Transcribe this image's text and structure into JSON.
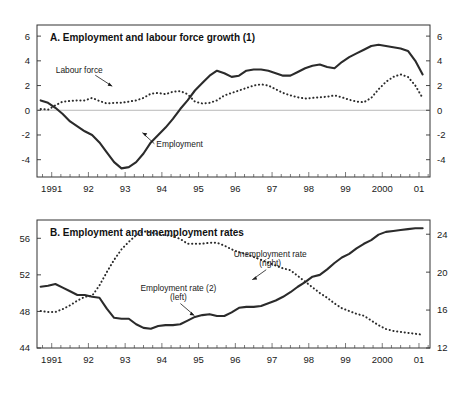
{
  "figure": {
    "background": "#ffffff",
    "series_color": "#2b2b2b",
    "frame_color": "#333333",
    "zeroline_color": "#b8b8b8"
  },
  "chart_data": [
    {
      "type": "line",
      "panel": "A",
      "title": "A. Employment and labour force growth (1)",
      "xlabel": "",
      "ylabel": "",
      "grid": false,
      "legend": "annotations",
      "x_ticklabels": [
        "1991",
        "92",
        "93",
        "94",
        "95",
        "96",
        "97",
        "98",
        "99",
        "2000",
        "01"
      ],
      "x_tickvalues": [
        1991,
        1992,
        1993,
        1994,
        1995,
        1996,
        1997,
        1998,
        1999,
        2000,
        2001
      ],
      "xlim": [
        1990.6,
        2001.3
      ],
      "ylim": [
        -5.4,
        6.9
      ],
      "y_left_ticks": [
        6,
        4,
        2,
        0,
        -2,
        -4
      ],
      "y_right_ticks": [
        6,
        4,
        2,
        0,
        -2,
        -4
      ],
      "zero_line": 0,
      "annotations": [
        {
          "text": "Labour force",
          "x": 1991.75,
          "y": 3.0
        },
        {
          "text": "Employment",
          "x": 1993.85,
          "y": -2.95
        }
      ],
      "series": [
        {
          "name": "Employment",
          "style": "solid",
          "x": [
            1990.7,
            1990.9,
            1991.1,
            1991.3,
            1991.5,
            1991.7,
            1991.9,
            1992.1,
            1992.3,
            1992.5,
            1992.7,
            1992.9,
            1993.1,
            1993.3,
            1993.5,
            1993.7,
            1993.9,
            1994.1,
            1994.3,
            1994.5,
            1994.7,
            1994.9,
            1995.1,
            1995.3,
            1995.5,
            1995.7,
            1995.9,
            1996.1,
            1996.3,
            1996.5,
            1996.7,
            1996.9,
            1997.1,
            1997.3,
            1997.5,
            1997.7,
            1997.9,
            1998.1,
            1998.3,
            1998.5,
            1998.7,
            1998.9,
            1999.1,
            1999.3,
            1999.5,
            1999.7,
            1999.9,
            2000.1,
            2000.3,
            2000.5,
            2000.7,
            2000.9,
            2001.1
          ],
          "values": [
            0.8,
            0.6,
            0.2,
            -0.3,
            -0.9,
            -1.3,
            -1.7,
            -2.0,
            -2.6,
            -3.4,
            -4.2,
            -4.7,
            -4.6,
            -4.2,
            -3.5,
            -2.6,
            -2.0,
            -1.4,
            -0.7,
            0.1,
            0.8,
            1.6,
            2.2,
            2.8,
            3.2,
            3.0,
            2.7,
            2.8,
            3.2,
            3.3,
            3.3,
            3.2,
            3.0,
            2.8,
            2.8,
            3.1,
            3.4,
            3.6,
            3.7,
            3.5,
            3.4,
            3.9,
            4.3,
            4.6,
            4.9,
            5.2,
            5.3,
            5.2,
            5.1,
            5.0,
            4.8,
            4.0,
            2.9
          ]
        },
        {
          "name": "Labour force",
          "style": "dotted",
          "x": [
            1990.7,
            1990.9,
            1991.1,
            1991.3,
            1991.5,
            1991.7,
            1991.9,
            1992.1,
            1992.3,
            1992.5,
            1992.7,
            1992.9,
            1993.1,
            1993.3,
            1993.5,
            1993.7,
            1993.9,
            1994.1,
            1994.3,
            1994.5,
            1994.7,
            1994.9,
            1995.1,
            1995.3,
            1995.5,
            1995.7,
            1995.9,
            1996.1,
            1996.3,
            1996.5,
            1996.7,
            1996.9,
            1997.1,
            1997.3,
            1997.5,
            1997.7,
            1997.9,
            1998.1,
            1998.3,
            1998.5,
            1998.7,
            1998.9,
            1999.1,
            1999.3,
            1999.5,
            1999.7,
            1999.9,
            2000.1,
            2000.3,
            2000.5,
            2000.7,
            2000.9,
            2001.1
          ],
          "values": [
            0.1,
            0.05,
            0.4,
            0.7,
            0.75,
            0.8,
            0.8,
            1.0,
            0.75,
            0.55,
            0.6,
            0.6,
            0.7,
            0.8,
            1.0,
            1.35,
            1.4,
            1.3,
            1.5,
            1.55,
            1.3,
            0.7,
            0.55,
            0.6,
            0.8,
            1.2,
            1.4,
            1.6,
            1.8,
            2.0,
            2.1,
            2.0,
            1.7,
            1.4,
            1.2,
            1.05,
            0.95,
            1.0,
            1.05,
            1.1,
            1.2,
            1.05,
            0.85,
            0.7,
            0.65,
            1.0,
            1.7,
            2.3,
            2.7,
            2.9,
            2.7,
            2.0,
            1.0
          ]
        }
      ]
    },
    {
      "type": "line",
      "panel": "B",
      "title": "B. Employment and unemployment rates",
      "xlabel": "",
      "ylabel": "",
      "grid": false,
      "legend": "annotations",
      "x_ticklabels": [
        "1991",
        "92",
        "93",
        "94",
        "95",
        "96",
        "97",
        "98",
        "99",
        "2000",
        "01"
      ],
      "x_tickvalues": [
        1991,
        1992,
        1993,
        1994,
        1995,
        1996,
        1997,
        1998,
        1999,
        2000,
        2001
      ],
      "xlim": [
        1990.6,
        2001.3
      ],
      "ylim_left": [
        44,
        58
      ],
      "ylim_right": [
        12,
        25.5
      ],
      "y_left_ticks": [
        56,
        52,
        48,
        44
      ],
      "y_right_ticks": [
        24,
        20,
        16,
        12
      ],
      "annotations": [
        {
          "text": "Employment rate (2)",
          "x": 1994.45,
          "y_left": 50.2
        },
        {
          "text": "(left)",
          "x": 1994.45,
          "y_left": 49.3
        },
        {
          "text": "Unemployment rate",
          "x": 1996.95,
          "y_left": 53.9
        },
        {
          "text": "(right)",
          "x": 1996.95,
          "y_left": 53.0
        }
      ],
      "series": [
        {
          "name": "Employment rate (2)",
          "axis": "left",
          "style": "solid",
          "x": [
            1990.7,
            1990.9,
            1991.1,
            1991.3,
            1991.5,
            1991.7,
            1991.9,
            1992.1,
            1992.3,
            1992.5,
            1992.7,
            1992.9,
            1993.1,
            1993.3,
            1993.5,
            1993.7,
            1993.9,
            1994.1,
            1994.3,
            1994.5,
            1994.7,
            1994.9,
            1995.1,
            1995.3,
            1995.5,
            1995.7,
            1995.9,
            1996.1,
            1996.3,
            1996.5,
            1996.7,
            1996.9,
            1997.1,
            1997.3,
            1997.5,
            1997.7,
            1997.9,
            1998.1,
            1998.3,
            1998.5,
            1998.7,
            1998.9,
            1999.1,
            1999.3,
            1999.5,
            1999.7,
            1999.9,
            2000.1,
            2000.3,
            2000.5,
            2000.7,
            2000.9,
            2001.1
          ],
          "values": [
            50.7,
            50.8,
            51.0,
            50.6,
            50.2,
            49.8,
            49.8,
            49.6,
            49.5,
            48.3,
            47.3,
            47.2,
            47.2,
            46.6,
            46.2,
            46.1,
            46.4,
            46.5,
            46.5,
            46.6,
            47.0,
            47.4,
            47.6,
            47.7,
            47.5,
            47.5,
            47.9,
            48.4,
            48.5,
            48.5,
            48.6,
            48.9,
            49.2,
            49.6,
            50.1,
            50.7,
            51.2,
            51.8,
            52.0,
            52.6,
            53.3,
            53.9,
            54.3,
            54.9,
            55.4,
            55.8,
            56.4,
            56.7,
            56.8,
            56.9,
            57.0,
            57.1,
            57.1
          ]
        },
        {
          "name": "Unemployment rate",
          "axis": "right",
          "style": "dotted",
          "x": [
            1990.7,
            1990.9,
            1991.1,
            1991.3,
            1991.5,
            1991.7,
            1991.9,
            1992.1,
            1992.3,
            1992.5,
            1992.7,
            1992.9,
            1993.1,
            1993.3,
            1993.5,
            1993.7,
            1993.9,
            1994.1,
            1994.3,
            1994.5,
            1994.7,
            1994.9,
            1995.1,
            1995.3,
            1995.5,
            1995.7,
            1995.9,
            1996.1,
            1996.3,
            1996.5,
            1996.7,
            1996.9,
            1997.1,
            1997.3,
            1997.5,
            1997.7,
            1997.9,
            1998.1,
            1998.3,
            1998.5,
            1998.7,
            1998.9,
            1999.1,
            1999.3,
            1999.5,
            1999.7,
            1999.9,
            2000.1,
            2000.3,
            2000.5,
            2000.7,
            2000.9,
            2001.1
          ],
          "values": [
            15.9,
            15.8,
            15.8,
            16.1,
            16.5,
            17.0,
            17.4,
            17.5,
            18.6,
            20.0,
            21.3,
            22.4,
            23.2,
            23.9,
            24.3,
            24.2,
            24.0,
            23.9,
            23.8,
            23.5,
            23.0,
            23.0,
            23.0,
            23.1,
            23.1,
            22.8,
            22.4,
            22.1,
            21.9,
            21.6,
            21.3,
            21.0,
            20.7,
            20.4,
            20.2,
            19.6,
            19.0,
            18.4,
            17.8,
            17.3,
            16.7,
            16.2,
            15.9,
            15.6,
            15.4,
            14.9,
            14.4,
            14.0,
            13.8,
            13.7,
            13.6,
            13.5,
            13.4
          ]
        }
      ]
    }
  ]
}
